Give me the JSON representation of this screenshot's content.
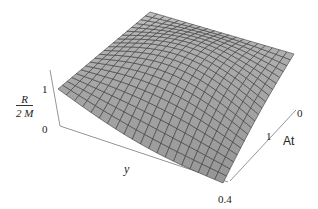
{
  "chart_data": {
    "type": "surface3d",
    "title": "",
    "zlabel": {
      "numerator": "R",
      "denominator": "2 M"
    },
    "xlabel": "y",
    "ylabel": "At",
    "z_ticks": [
      "1",
      "0"
    ],
    "x_ticks": [
      "0.4"
    ],
    "y_ticks": [
      "1",
      "0"
    ],
    "x_range": [
      0,
      0.4
    ],
    "y_range": [
      0,
      1.5
    ],
    "z_range": [
      0,
      1.3
    ],
    "grid": {
      "u_lines": 20,
      "v_lines": 20
    },
    "surface_description": "Dome-shaped surface: R/2M ≈ 1 at the back edge (y=0), peaking near the back corner and falling toward the front corner at y=0.4, At=0; mesh grid overlaid.",
    "colors": {
      "surface": "#a7a7a7",
      "mesh": "#3a3a3a",
      "axes": "#7a7a7a"
    }
  },
  "labels": {
    "z_one": "1",
    "z_zero": "0",
    "x_label": "y",
    "x_tick": "0.4",
    "y_label": "At",
    "y_tick_one": "1",
    "y_tick_zero": "0",
    "frac_num": "R",
    "frac_den": "2 M"
  }
}
